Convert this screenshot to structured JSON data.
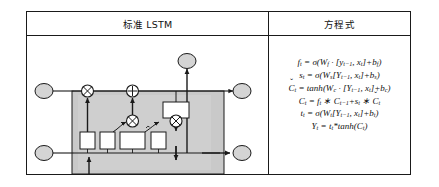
{
  "table": {
    "headers": {
      "left": "标准 LSTM",
      "right": "方程式"
    }
  },
  "equations": [
    {
      "id": "forget-gate",
      "html": "f<sub>t</sub> = σ(W<sub>f</sub> · [y<sub>t−1</sub>, x<sub>t</sub>]+b<sub>f</sub>)",
      "plain": "f_t = σ(W_f · [y_{t−1}, x_t]+b_f)"
    },
    {
      "id": "input-gate",
      "html": "s<sub>t</sub> = σ(W<sub>s</sub>[Y<sub>t−1</sub>, x<sub>t</sub>]+b<sub>s</sub>)",
      "plain": "s_t = σ(W_s[Y_{t−1}, x_t]+b_s)"
    },
    {
      "id": "candidate-cell",
      "html": "<span class=\"up\"><span class=\"hat\">ˇ</span>C</span><sub>t</sub> = <span class=\"fn\">tanh</span>(W<sub>c</sub> · [Y<sub>t−1</sub>, x<sub>t</sub>]+b<sub>c</sub>)",
      "plain": "Č_t = tanh(W_c · [Y_{t−1}, x_t]+b_c)"
    },
    {
      "id": "cell-state",
      "html": "C<sub>t</sub> = f<sub>t</sub> ∗ C<sub>t−1</sub>+s<sub>t</sub> ∗ <span class=\"up\"><span class=\"hat\">ˇ</span>C</span><sub>t</sub>",
      "plain": "C_t = f_t * C_{t−1}+s_t * Č_t"
    },
    {
      "id": "output-gate",
      "html": "t<sub>t</sub> = σ(W<sub>t</sub>[Y<sub>t−1</sub>, x<sub>t</sub>]+b<sub>t</sub>)",
      "plain": "t_t = σ(W_t[Y_{t−1}, x_t]+b_t)"
    },
    {
      "id": "hidden-state",
      "html": "Y<sub>t</sub> = t<sub>t</sub>*<span class=\"fn\">tanh</span>(C<sub>t</sub>)",
      "plain": "Y_t = t_t*tanh(C_t)"
    }
  ],
  "diagram": {
    "name": "standard-lstm-cell-diagram",
    "colors": {
      "cell_fill": "#c9c9c9",
      "node_fill": "#d4d4d4",
      "box_fill": "#ffffff",
      "stroke": "#1a1a1a"
    },
    "nodes": [
      {
        "id": "cell-state-in",
        "label": "",
        "cx": 41,
        "cy": 66
      },
      {
        "id": "cell-state-out",
        "label": "",
        "cx": 211,
        "cy": 66
      },
      {
        "id": "hidden-in",
        "label": "",
        "cx": 41,
        "cy": 130
      },
      {
        "id": "hidden-out",
        "label": "",
        "cx": 211,
        "cy": 130
      },
      {
        "id": "input-x",
        "label": "",
        "cx": 80,
        "cy": 166
      },
      {
        "id": "output-y",
        "label": "",
        "cx": 175,
        "cy": 46
      }
    ],
    "operators": [
      {
        "id": "forget-multiply",
        "glyph": "x",
        "cx": 77,
        "cy": 66
      },
      {
        "id": "state-add",
        "glyph": "+",
        "cx": 125,
        "cy": 66
      },
      {
        "id": "input-multiply",
        "glyph": "x",
        "cx": 125,
        "cy": 104
      },
      {
        "id": "output-multiply",
        "glyph": "x",
        "cx": 175,
        "cy": 104
      }
    ],
    "gates": [
      {
        "id": "forget-gate-box",
        "x": 67,
        "y": 121,
        "w": 18,
        "h": 17
      },
      {
        "id": "input-gate-box",
        "x": 91,
        "y": 121,
        "w": 18,
        "h": 17
      },
      {
        "id": "candidate-gate-box",
        "x": 114,
        "y": 121,
        "w": 27,
        "h": 17
      },
      {
        "id": "output-gate-box",
        "x": 146,
        "y": 121,
        "w": 18,
        "h": 17
      },
      {
        "id": "tanh-box",
        "x": 162,
        "y": 78,
        "w": 28,
        "h": 17
      }
    ]
  }
}
